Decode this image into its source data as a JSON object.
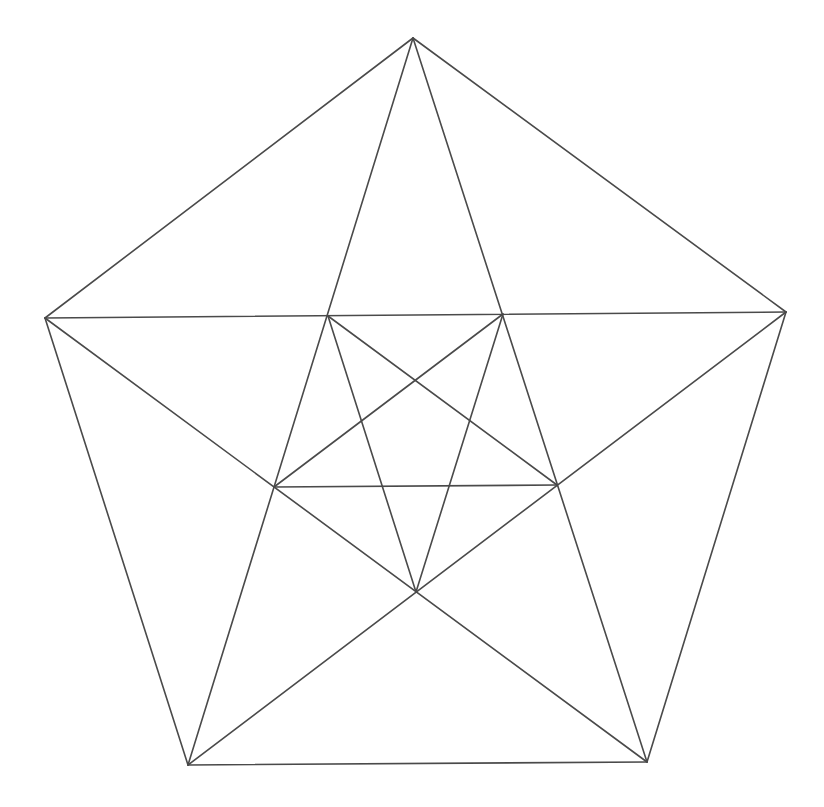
{
  "diagram": {
    "stroke_color": "#4a4a4a",
    "background": "#ffffff",
    "points": {
      "A": [
        413,
        38
      ],
      "B": [
        786,
        312
      ],
      "C": [
        647,
        762
      ],
      "D": [
        188,
        765
      ],
      "E": [
        45,
        318
      ],
      "P1": [
        328,
        316
      ],
      "P2": [
        503,
        314
      ],
      "P3": [
        557,
        485
      ],
      "P4": [
        416,
        592
      ],
      "P5": [
        274,
        487
      ]
    },
    "segments": [
      {
        "name": "outer-edge-ab",
        "from": "A",
        "to": "B"
      },
      {
        "name": "outer-edge-bc",
        "from": "B",
        "to": "C"
      },
      {
        "name": "outer-edge-cd",
        "from": "C",
        "to": "D"
      },
      {
        "name": "outer-edge-de",
        "from": "D",
        "to": "E"
      },
      {
        "name": "outer-edge-ea",
        "from": "E",
        "to": "A"
      },
      {
        "name": "diagonal-e-b",
        "from": "E",
        "to": "B"
      },
      {
        "name": "diagonal-a-d",
        "from": "A",
        "to": "D"
      },
      {
        "name": "diagonal-a-c",
        "from": "A",
        "to": "C"
      },
      {
        "name": "diagonal-e-c",
        "from": "E",
        "to": "C"
      },
      {
        "name": "diagonal-b-d",
        "from": "B",
        "to": "D"
      },
      {
        "name": "inner-p5-p3",
        "from": "P5",
        "to": "P3"
      },
      {
        "name": "inner-p1-p3",
        "from": "P1",
        "to": "P3"
      },
      {
        "name": "inner-p2-p5",
        "from": "P2",
        "to": "P5"
      },
      {
        "name": "inner-p1-p4",
        "from": "P1",
        "to": "P4"
      },
      {
        "name": "inner-p2-p4",
        "from": "P2",
        "to": "P4"
      }
    ]
  }
}
